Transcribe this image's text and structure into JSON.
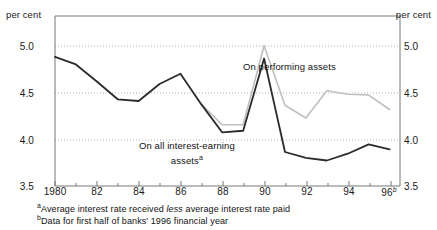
{
  "chart_data": {
    "type": "line",
    "title": "",
    "xlabel": "",
    "ylabel": "per cent",
    "unit_left": "per cent",
    "unit_right": "per cent",
    "ylim": [
      3.5,
      5.5
    ],
    "xlim": [
      1980,
      1996.5
    ],
    "grid": true,
    "gridlines": [
      5.0,
      4.5,
      4.0
    ],
    "ytick_labels": [
      "5.0",
      "4.5",
      "4.0",
      "3.5"
    ],
    "ytick_values": [
      5.0,
      4.5,
      4.0,
      3.5
    ],
    "xtick_labels": [
      "1980",
      "82",
      "84",
      "86",
      "88",
      "90",
      "92",
      "94",
      "96"
    ],
    "xtick_values": [
      1980,
      1982,
      1984,
      1986,
      1988,
      1990,
      1992,
      1994,
      1996
    ],
    "xtick_last_superscript": "b",
    "legend_position": "inline-annotations",
    "series": [
      {
        "name": "On all interest-earning assets",
        "label_annotation": "On all interest-earning\nassets",
        "label_superscript": "a",
        "color": "#2b2b2b",
        "width": 1.8,
        "x": [
          1980,
          1981,
          1982,
          1983,
          1984,
          1985,
          1986,
          1987,
          1988,
          1989,
          1990,
          1991,
          1992,
          1993,
          1994,
          1995,
          1996
        ],
        "values": [
          5.02,
          4.93,
          4.73,
          4.52,
          4.5,
          4.7,
          4.82,
          4.46,
          4.13,
          4.15,
          5.0,
          3.9,
          3.83,
          3.8,
          3.88,
          3.99,
          3.93
        ]
      },
      {
        "name": "On performing assets",
        "label_annotation": "On performing assets",
        "color": "#bfbfbf",
        "width": 1.6,
        "x": [
          1987,
          1988,
          1989,
          1990,
          1991,
          1992,
          1993,
          1994,
          1995,
          1996
        ],
        "values": [
          4.46,
          4.22,
          4.22,
          5.15,
          4.45,
          4.3,
          4.62,
          4.58,
          4.57,
          4.4
        ]
      }
    ],
    "annotations": [
      {
        "text": "On performing assets",
        "x_px": 243,
        "y_px": 61
      },
      {
        "text": "On all interest-earning assets",
        "x_px": 139,
        "y_px": 140,
        "superscript": "a"
      }
    ]
  },
  "footnotes": {
    "a_marker": "a",
    "a_pre": "Average interest rate received ",
    "a_em": "less",
    "a_post": " average interest rate paid",
    "b_marker": "b",
    "b_text": "Data for first half of banks' 1996 financial year"
  },
  "axis": {
    "unit_left": "per cent",
    "unit_right": "per cent",
    "y_labels": [
      "5.0",
      "4.5",
      "4.0",
      "3.5"
    ],
    "x_labels": [
      "1980",
      "82",
      "84",
      "86",
      "88",
      "90",
      "92",
      "94",
      "96"
    ],
    "x_last_sup": "b"
  },
  "series_labels": {
    "performing_line1": "On performing assets",
    "all_line1": "On all interest-earning",
    "all_line2": "assets",
    "all_sup": "a"
  },
  "colors": {
    "dark_series": "#2b2b2b",
    "light_series": "#bfbfbf",
    "axis": "#6e6e6e",
    "grid": "#b8b8b8",
    "text": "#1a1a1a"
  }
}
